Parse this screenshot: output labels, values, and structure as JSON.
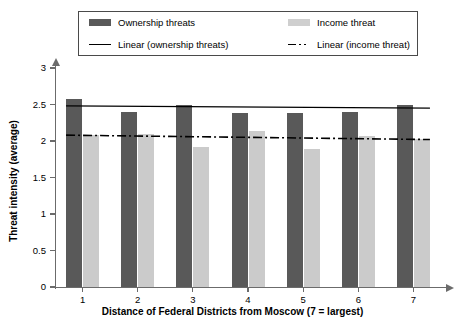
{
  "chart_data": {
    "type": "bar",
    "title": "",
    "xlabel": "Distance of Federal Districts from Moscow (7 = largest)",
    "ylabel": "Threat intensity (average)",
    "categories": [
      "1",
      "2",
      "3",
      "4",
      "5",
      "6",
      "7"
    ],
    "ylim": [
      0,
      3
    ],
    "yticks": [
      "0",
      "0.5",
      "1",
      "1.5",
      "2",
      "2.5",
      "3"
    ],
    "ytick_values": [
      0,
      0.5,
      1,
      1.5,
      2,
      2.5,
      3
    ],
    "grid": false,
    "legend_position": "top",
    "series": [
      {
        "name": "Ownership threats",
        "color": "#595959",
        "values": [
          2.57,
          2.4,
          2.5,
          2.39,
          2.39,
          2.4,
          2.5
        ]
      },
      {
        "name": "Income threat",
        "color": "#cbcbcb",
        "values": [
          2.08,
          2.1,
          1.92,
          2.14,
          1.89,
          2.07,
          2.03
        ]
      }
    ],
    "trendlines": [
      {
        "name": "Linear (ownership threats)",
        "style": "solid",
        "color": "#000000",
        "start_value": 2.48,
        "end_value": 2.45
      },
      {
        "name": "Linear (income threat)",
        "style": "dash-dot",
        "color": "#000000",
        "start_value": 2.08,
        "end_value": 2.02
      }
    ]
  },
  "legend": {
    "items": [
      {
        "label": "Ownership threats",
        "marker": "dark-swatch"
      },
      {
        "label": "Income threat",
        "marker": "light-swatch"
      },
      {
        "label": "Linear (ownership threats)",
        "marker": "solid-line"
      },
      {
        "label": "Linear (income threat)",
        "marker": "dash-dot-line"
      }
    ]
  },
  "axes": {
    "x_title": "Distance of Federal Districts from Moscow (7 = largest)",
    "y_title": "Threat intensity (average)",
    "y_tick_labels": [
      "3",
      "2.5",
      "2",
      "1.5",
      "1",
      "0.5",
      "0"
    ],
    "x_tick_labels": [
      "1",
      "2",
      "3",
      "4",
      "5",
      "6",
      "7"
    ]
  }
}
